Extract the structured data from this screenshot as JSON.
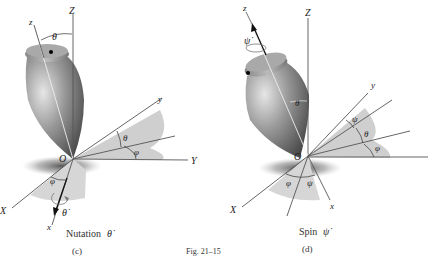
{
  "figure": {
    "caption": "Fig. 21–15",
    "panels": [
      {
        "id": "c",
        "sub_label": "(c)",
        "title": "Nutation",
        "rate_symbol": "θ̇",
        "axes": {
          "Z": "Z",
          "z": "z",
          "X": "X",
          "x": "x",
          "Y": "Y",
          "y": "y",
          "origin": "O"
        },
        "angles": {
          "theta_top": "θ",
          "theta_plane": "θ",
          "phi_plane": "φ",
          "phi_bottom": "φ",
          "rate_label": "θ̇"
        }
      },
      {
        "id": "d",
        "sub_label": "(d)",
        "title": "Spin",
        "rate_symbol": "ψ̇",
        "axes": {
          "Z": "Z",
          "z": "z",
          "X": "X",
          "x": "x",
          "y": "y",
          "origin": "O"
        },
        "angles": {
          "theta_body": "θ",
          "psi_plane": "ψ",
          "theta_plane": "θ",
          "phi_plane": "φ",
          "phi_bottom": "φ",
          "psi_bottom": "ψ",
          "rate_label": "ψ̇"
        }
      }
    ]
  }
}
